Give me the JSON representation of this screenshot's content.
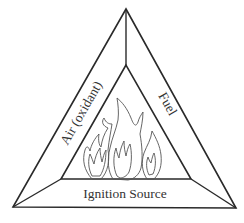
{
  "diagram": {
    "type": "fire-triangle",
    "colors": {
      "background": "#ffffff",
      "line": "#2a2a2a",
      "flame": "#555555",
      "text": "#333333"
    },
    "sides": {
      "left": {
        "label": "Air (oxidant)"
      },
      "right": {
        "label": "Fuel"
      },
      "bottom": {
        "label": "Ignition Source"
      }
    },
    "center": {
      "icon": "flames-icon",
      "flame_count": 3
    }
  }
}
